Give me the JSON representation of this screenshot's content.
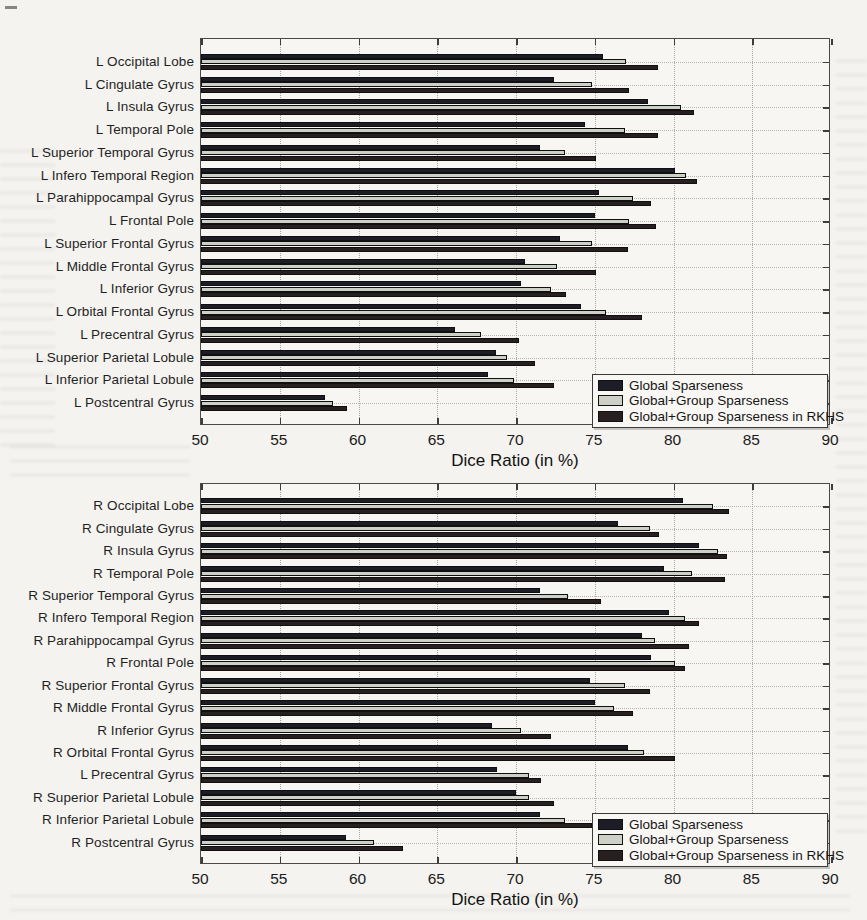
{
  "figure": {
    "type": "grouped-horizontal-bar-figure",
    "xlabel": "Dice Ratio (in %)",
    "x_ticks": [
      50,
      55,
      60,
      65,
      70,
      75,
      80,
      85,
      90
    ],
    "xlim": [
      50,
      90
    ],
    "grid": true,
    "legend_position": "bottom-right",
    "series_colors": {
      "global": "#1d1d27",
      "global_group": "#ccd0c7",
      "global_group_rkhs": "#282020"
    },
    "legend_labels": [
      "Global Sparseness",
      "Global+Group Sparseness",
      "Global+Group Sparseness in RKHS"
    ]
  },
  "chart_data": [
    {
      "type": "bar",
      "orientation": "horizontal",
      "title": "",
      "xlabel": "Dice Ratio (in %)",
      "ylabel": "",
      "xlim": [
        50,
        90
      ],
      "x_ticks": [
        50,
        55,
        60,
        65,
        70,
        75,
        80,
        85,
        90
      ],
      "grid": true,
      "legend_position": "bottom-right",
      "categories": [
        "L Occipital Lobe",
        "L Cingulate Gyrus",
        "L Insula Gyrus",
        "L Temporal Pole",
        "L Superior Temporal Gyrus",
        "L Infero Temporal Region",
        "L Parahippocampal Gyrus",
        "L Frontal Pole",
        "L Superior Frontal Gyrus",
        "L Middle Frontal Gyrus",
        "L Inferior Gyrus",
        "L Orbital Frontal Gyrus",
        "L Precentral Gyrus",
        "L Superior Parietal Lobule",
        "L Inferior Parietal Lobule",
        "L Postcentral Gyrus"
      ],
      "series": [
        {
          "name": "Global Sparseness",
          "color": "#1d1d27",
          "values": [
            75.5,
            72.4,
            78.4,
            74.4,
            71.5,
            80.1,
            75.3,
            75.0,
            72.8,
            70.6,
            70.3,
            74.1,
            66.1,
            68.7,
            68.2,
            57.9
          ]
        },
        {
          "name": "Global+Group Sparseness",
          "color": "#ccd0c7",
          "values": [
            77.0,
            74.8,
            80.5,
            76.9,
            73.1,
            80.8,
            77.4,
            77.2,
            74.8,
            72.6,
            72.2,
            75.7,
            67.8,
            69.4,
            69.9,
            58.4
          ]
        },
        {
          "name": "Global+Group Sparseness in RKHS",
          "color": "#282020",
          "values": [
            79.0,
            77.2,
            81.3,
            79.0,
            75.1,
            81.5,
            78.6,
            78.9,
            77.1,
            75.1,
            73.2,
            78.0,
            70.2,
            71.2,
            72.4,
            59.3
          ]
        }
      ]
    },
    {
      "type": "bar",
      "orientation": "horizontal",
      "title": "",
      "xlabel": "Dice Ratio (in %)",
      "ylabel": "",
      "xlim": [
        50,
        90
      ],
      "x_ticks": [
        50,
        55,
        60,
        65,
        70,
        75,
        80,
        85,
        90
      ],
      "grid": true,
      "legend_position": "bottom-right",
      "categories": [
        "R Occipital Lobe",
        "R Cingulate Gyrus",
        "R Insula Gyrus",
        "R Temporal Pole",
        "R Superior Temporal Gyrus",
        "R Infero Temporal Region",
        "R Parahippocampal Gyrus",
        "R Frontal Pole",
        "R Superior Frontal Gyrus",
        "R Middle Frontal Gyrus",
        "R Inferior Gyrus",
        "R Orbital Frontal Gyrus",
        "L Precentral Gyrus",
        "R Superior Parietal Lobule",
        "R Inferior Parietal Lobule",
        "R Postcentral Gyrus"
      ],
      "series": [
        {
          "name": "Global Sparseness",
          "color": "#1d1d27",
          "values": [
            80.6,
            76.5,
            81.6,
            79.4,
            71.5,
            79.7,
            78.0,
            78.6,
            74.7,
            75.0,
            68.5,
            77.1,
            68.8,
            70.0,
            71.5,
            59.2
          ]
        },
        {
          "name": "Global+Group Sparseness",
          "color": "#ccd0c7",
          "values": [
            82.5,
            78.5,
            82.8,
            81.2,
            73.3,
            80.7,
            78.8,
            80.1,
            76.9,
            76.2,
            70.3,
            78.1,
            70.8,
            70.8,
            73.1,
            61.0
          ]
        },
        {
          "name": "Global+Group Sparseness in RKHS",
          "color": "#282020",
          "values": [
            83.5,
            79.1,
            83.4,
            83.3,
            75.4,
            81.6,
            81.0,
            80.7,
            78.5,
            77.4,
            72.2,
            80.1,
            71.6,
            72.4,
            74.8,
            62.8
          ]
        }
      ]
    }
  ],
  "layout": {
    "charts": [
      {
        "plot_left": 200,
        "plot_top": 38,
        "plot_width": 630,
        "plot_height": 387
      },
      {
        "plot_left": 200,
        "plot_top": 483,
        "plot_width": 630,
        "plot_height": 381
      }
    ],
    "legend": {
      "width": 236,
      "height": 54,
      "right_inset": 2,
      "bottom_inset": -3
    }
  }
}
